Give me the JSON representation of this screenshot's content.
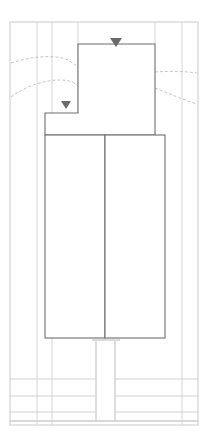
{
  "drawing": {
    "title": "Floor Plan",
    "width": 215,
    "height": 444,
    "background": "#ffffff"
  },
  "colors": {
    "outer_frame": "#c9c9c9",
    "grid_line": "#d6d6d6",
    "thin_wall": "#cfcfcf",
    "heavy_wall": "#6e6e6e",
    "medium_wall": "#9a9a9a",
    "dashed_contour": "#c4c4c4",
    "marker_fill": "#6a6a6a"
  },
  "outer_frame": {
    "label": "drawing-border",
    "x": 10,
    "y": 22,
    "width": 188,
    "height": 403
  },
  "grid_lines": {
    "vertical": [
      {
        "name": "grid-v-1",
        "x": 37,
        "y1": 22,
        "y2": 425
      },
      {
        "name": "grid-v-2",
        "x": 52,
        "y1": 22,
        "y2": 425
      },
      {
        "name": "grid-v-3",
        "x": 78,
        "y1": 22,
        "y2": 135
      },
      {
        "name": "grid-v-4",
        "x": 155,
        "y1": 22,
        "y2": 44
      },
      {
        "name": "grid-v-5",
        "x": 182,
        "y1": 22,
        "y2": 425
      }
    ],
    "horizontal": [
      {
        "name": "grid-h-1",
        "y": 379,
        "x1": 10,
        "x2": 198
      },
      {
        "name": "grid-h-2",
        "y": 396,
        "x1": 10,
        "x2": 198
      },
      {
        "name": "grid-h-3",
        "y": 412,
        "x1": 10,
        "x2": 198
      },
      {
        "name": "grid-h-4",
        "y": 421,
        "x1": 10,
        "x2": 198
      }
    ]
  },
  "rooms": [
    {
      "name": "upper-room",
      "label": "upper-chamber",
      "points": "78,44 155,44 155,135 45,135 45,113 78,113",
      "stroke": "#6e6e6e",
      "stroke_width": 1.1
    },
    {
      "name": "lower-room-left",
      "label": "lower-chamber-left",
      "x": 45,
      "y": 135,
      "width": 60,
      "height": 203,
      "stroke": "#6e6e6e",
      "stroke_width": 1.1
    },
    {
      "name": "lower-room-right",
      "label": "lower-chamber-right",
      "x": 105,
      "y": 135,
      "width": 60,
      "height": 203,
      "stroke": "#6e6e6e",
      "stroke_width": 1.1
    }
  ],
  "corridor": {
    "name": "central-corridor",
    "label": "corridor-shaft",
    "left_x": 96,
    "right_x": 115,
    "top_y": 341,
    "bottom_y": 421,
    "cap_y": 338,
    "cap_x1": 92,
    "cap_x2": 120
  },
  "markers": [
    {
      "name": "section-marker-upper",
      "label": "section-marker-a",
      "cx": 116,
      "cy": 38,
      "size": 12,
      "direction": "down"
    },
    {
      "name": "section-marker-lower",
      "label": "section-marker-b",
      "cx": 66,
      "cy": 102,
      "size": 10,
      "direction": "down"
    }
  ],
  "contours": [
    {
      "name": "contour-upper-left",
      "path": "M 11,63 C 30,57 48,55 62,58 C 70,60 74,64 78,67",
      "dash": "3 2"
    },
    {
      "name": "contour-lower-left",
      "path": "M 11,97 C 26,86 44,80 60,80 C 70,80 75,83 78,86",
      "dash": "3 2"
    },
    {
      "name": "contour-upper-right",
      "path": "M 155,72 C 168,71 182,71 197,73",
      "dash": "3 2"
    },
    {
      "name": "contour-lower-right",
      "path": "M 155,88 C 170,94 184,100 197,104",
      "dash": "3 2"
    }
  ],
  "bottom_bands": [
    {
      "name": "band-row-1",
      "y": 379,
      "height": 17
    },
    {
      "name": "band-row-2",
      "y": 396,
      "height": 16
    },
    {
      "name": "band-row-3",
      "y": 412,
      "height": 9
    }
  ]
}
